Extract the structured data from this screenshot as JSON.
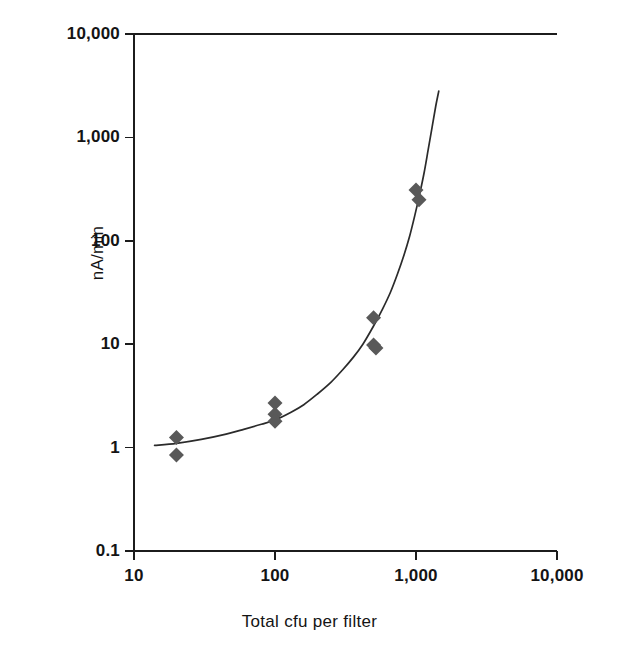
{
  "chart_data": {
    "type": "scatter",
    "title": "",
    "xlabel": "Total cfu per filter",
    "ylabel": "nA/min",
    "xscale": "log",
    "yscale": "log",
    "xlim": [
      10,
      10000
    ],
    "ylim": [
      0.1,
      10000
    ],
    "grid": false,
    "legend": null,
    "x_ticks": [
      "10",
      "100",
      "1,000",
      "10,000"
    ],
    "x_tick_values": [
      10,
      100,
      1000,
      10000
    ],
    "y_ticks": [
      "10,000",
      "1,000",
      "100",
      "10",
      "1",
      "0.1"
    ],
    "y_tick_values": [
      10000,
      1000,
      100,
      10,
      1,
      0.1
    ],
    "marker": {
      "shape": "diamond",
      "color": "#595959",
      "size_px": 15
    },
    "series": [
      {
        "name": "measurements",
        "type": "scatter",
        "points": [
          {
            "x": 20,
            "y": 1.25
          },
          {
            "x": 20,
            "y": 0.85
          },
          {
            "x": 100,
            "y": 2.7
          },
          {
            "x": 100,
            "y": 2.1
          },
          {
            "x": 100,
            "y": 1.8
          },
          {
            "x": 500,
            "y": 18
          },
          {
            "x": 500,
            "y": 9.8
          },
          {
            "x": 520,
            "y": 9.2
          },
          {
            "x": 1000,
            "y": 310
          },
          {
            "x": 1050,
            "y": 250
          }
        ]
      },
      {
        "name": "fitted-curve",
        "type": "line",
        "color": "#2b2b2b",
        "points": [
          {
            "x": 14,
            "y": 1.05
          },
          {
            "x": 20,
            "y": 1.1
          },
          {
            "x": 30,
            "y": 1.2
          },
          {
            "x": 45,
            "y": 1.35
          },
          {
            "x": 60,
            "y": 1.5
          },
          {
            "x": 80,
            "y": 1.68
          },
          {
            "x": 100,
            "y": 1.85
          },
          {
            "x": 130,
            "y": 2.2
          },
          {
            "x": 160,
            "y": 2.6
          },
          {
            "x": 200,
            "y": 3.3
          },
          {
            "x": 250,
            "y": 4.3
          },
          {
            "x": 300,
            "y": 5.6
          },
          {
            "x": 360,
            "y": 7.5
          },
          {
            "x": 420,
            "y": 10
          },
          {
            "x": 500,
            "y": 15
          },
          {
            "x": 580,
            "y": 22
          },
          {
            "x": 660,
            "y": 32
          },
          {
            "x": 740,
            "y": 48
          },
          {
            "x": 820,
            "y": 72
          },
          {
            "x": 900,
            "y": 110
          },
          {
            "x": 980,
            "y": 175
          },
          {
            "x": 1060,
            "y": 280
          },
          {
            "x": 1140,
            "y": 450
          },
          {
            "x": 1220,
            "y": 760
          },
          {
            "x": 1300,
            "y": 1250
          },
          {
            "x": 1380,
            "y": 2000
          },
          {
            "x": 1450,
            "y": 2800
          }
        ]
      }
    ]
  },
  "figure": {
    "x_axis_title": "Total cfu per filter",
    "y_axis_title": "nA/min"
  }
}
